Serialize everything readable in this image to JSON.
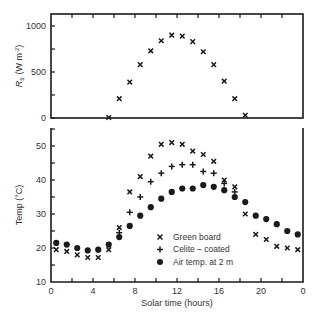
{
  "chart_data": [
    {
      "type": "scatter",
      "title": "",
      "xlabel": "",
      "ylabel": "R_s (W m^-2)",
      "ylabel_main": "R",
      "ylabel_sub": "s",
      "ylabel_units": "(W m",
      "ylabel_exp": "-2",
      "ylabel_close": ")",
      "ylim": [
        0,
        1000
      ],
      "xlim": [
        0,
        24
      ],
      "yticks": [
        0,
        500,
        1000
      ],
      "ytick_labels": [
        "0",
        "500",
        "1000"
      ],
      "grid": false,
      "series": [
        {
          "name": "Solar radiation",
          "marker": "x",
          "x": [
            5.5,
            6.5,
            7.5,
            8.5,
            9.5,
            10.5,
            11.5,
            12.5,
            13.5,
            14.5,
            15.5,
            16.5,
            17.5,
            18.5
          ],
          "values": [
            5,
            210,
            390,
            580,
            730,
            840,
            900,
            890,
            830,
            720,
            580,
            400,
            210,
            30
          ]
        }
      ]
    },
    {
      "type": "scatter",
      "title": "",
      "xlabel": "Solar time (hours)",
      "ylabel": "Temp (°C)",
      "ylim": [
        10,
        55
      ],
      "xlim": [
        0,
        24
      ],
      "xticks": [
        0,
        4,
        8,
        12,
        16,
        20,
        24
      ],
      "xtick_labels": [
        "0",
        "4",
        "8",
        "12",
        "16",
        "20",
        "0"
      ],
      "yticks": [
        10,
        20,
        30,
        40,
        50
      ],
      "ytick_labels": [
        "10",
        "20",
        "30",
        "40",
        "50"
      ],
      "grid": false,
      "legend_position": "lower center",
      "series": [
        {
          "name": "Green board",
          "marker": "x",
          "x": [
            0.5,
            1.5,
            2.5,
            3.5,
            4.5,
            5.5,
            6.5,
            7.5,
            8.5,
            9.5,
            10.5,
            11.5,
            12.5,
            13.5,
            14.5,
            15.5,
            16.5,
            17.5,
            18.5,
            19.5,
            20.5,
            21.5,
            22.5,
            23.5
          ],
          "values": [
            19.5,
            19,
            18,
            17.2,
            17.2,
            19.5,
            26,
            36.5,
            41,
            47,
            50.5,
            51,
            50.5,
            48.5,
            47.5,
            45.5,
            40,
            38,
            30,
            24,
            22.5,
            20.5,
            20,
            19.5
          ]
        },
        {
          "name": "Celite-coated",
          "marker": "+",
          "x": [
            6.5,
            7.5,
            8.5,
            9.5,
            10.5,
            11.5,
            12.5,
            13.5,
            14.5,
            15.5,
            16.5,
            17.5
          ],
          "values": [
            24.5,
            30.5,
            35,
            39.5,
            42,
            44,
            44.5,
            44.5,
            42.5,
            42,
            39,
            36.5
          ]
        },
        {
          "name": "Air temp. at 2 m",
          "marker": "o",
          "x": [
            0.5,
            1.5,
            2.5,
            3.5,
            4.5,
            5.5,
            6.5,
            7.5,
            8.5,
            9.5,
            10.5,
            11.5,
            12.5,
            13.5,
            14.5,
            15.5,
            16.5,
            17.5,
            18.5,
            19.5,
            20.5,
            21.5,
            22.5,
            23.5
          ],
          "values": [
            21.5,
            21,
            20,
            19.3,
            19.5,
            21,
            23.2,
            26.5,
            29.5,
            32,
            34.5,
            36.5,
            37.5,
            37.5,
            38.5,
            38,
            37,
            35,
            33.5,
            29.5,
            28.5,
            27,
            25,
            24
          ]
        }
      ]
    }
  ],
  "legend": {
    "items": [
      {
        "label": "Green board",
        "marker": "x"
      },
      {
        "label": "Celite – coated",
        "marker": "+"
      },
      {
        "label": "Air temp. at 2 m",
        "marker": "o"
      }
    ]
  },
  "colors": {
    "ink": "#1a1a1a",
    "background": "#ffffff"
  }
}
